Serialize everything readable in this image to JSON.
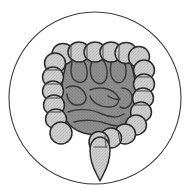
{
  "image": {
    "kind": "medical-anatomy-icon",
    "subject": "human intestines",
    "title": "Intestines Icon",
    "style": "grayscale line art in circular frame",
    "background_color": "#ffffff",
    "width": 190,
    "height": 196
  },
  "palette": {
    "background": "#ffffff",
    "outline": "#2b2b2b",
    "circle_stroke": "#3a3a3a",
    "large_intestine_fill": "#cacaca",
    "large_intestine_shade": "#b4b4b4",
    "small_intestine_fill": "#8e8e8e",
    "small_intestine_shade": "#7b7b7b",
    "small_intestine_dark": "#6e6e6e",
    "speckle": "#a8a8a8"
  },
  "frame": {
    "label": "circular frame",
    "shape": "circle",
    "center_x": 95,
    "center_y": 98,
    "radius": 86,
    "stroke_width": 1.1,
    "fill": "none"
  },
  "anatomy": {
    "parts": [
      {
        "id": "ascending-colon",
        "label": "Ascending colon",
        "group": "large-intestine",
        "fill": "#cacaca",
        "haustra_count": 6,
        "position": "left vertical chain"
      },
      {
        "id": "transverse-colon",
        "label": "Transverse colon",
        "group": "large-intestine",
        "fill": "#cacaca",
        "haustra_count": 7,
        "position": "top horizontal chain"
      },
      {
        "id": "descending-colon",
        "label": "Descending colon",
        "group": "large-intestine",
        "fill": "#cacaca",
        "haustra_count": 6,
        "position": "right vertical chain"
      },
      {
        "id": "sigmoid-colon",
        "label": "Sigmoid colon",
        "group": "large-intestine",
        "fill": "#cacaca",
        "haustra_count": 4,
        "position": "lower center curve"
      },
      {
        "id": "cecum",
        "label": "Cecum",
        "group": "large-intestine",
        "fill": "#cacaca",
        "position": "lower left"
      },
      {
        "id": "rectum",
        "label": "Rectum",
        "group": "large-intestine",
        "fill": "#cacaca",
        "position": "bottom center, tapering to point"
      },
      {
        "id": "small-intestine",
        "label": "Small intestine",
        "group": "small-intestine",
        "fill": "#8e8e8e",
        "loop_count": 9,
        "position": "coiled mass in center"
      }
    ]
  },
  "caption": ""
}
